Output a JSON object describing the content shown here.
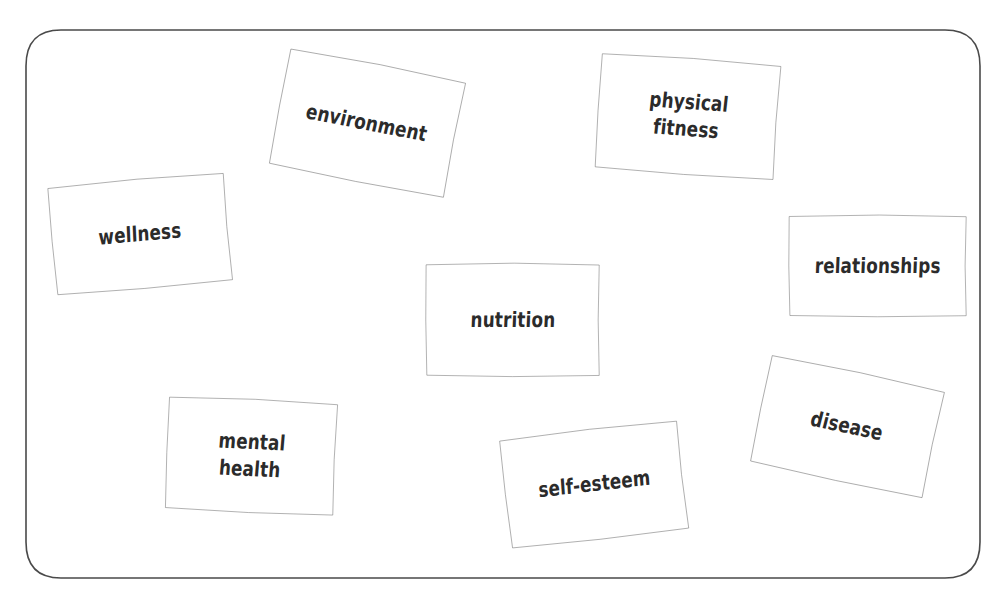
{
  "diagram": {
    "type": "concept-map",
    "title": "",
    "frame": {
      "shape": "rounded-rectangle",
      "stroke_color": "#4a4a4a",
      "fill_color": "#ffffff",
      "corner_radius_px": 36
    },
    "style": {
      "node_shape": "rectangle",
      "node_stroke_color": "#555555",
      "node_fill_color": "#ffffff",
      "label_color": "#2b2b2b",
      "handwritten": true
    },
    "nodes": [
      {
        "id": "environment",
        "label": "environment",
        "x": 276,
        "y": 62,
        "width": 182,
        "height": 122,
        "rotation_deg": 11
      },
      {
        "id": "physical-fitness",
        "label": "physical\nfitness",
        "x": 596,
        "y": 57,
        "width": 183,
        "height": 119,
        "rotation_deg": 4
      },
      {
        "id": "wellness",
        "label": "wellness",
        "x": 50,
        "y": 178,
        "width": 180,
        "height": 112,
        "rotation_deg": -5
      },
      {
        "id": "relationships",
        "label": "relationships",
        "x": 787,
        "y": 214,
        "width": 181,
        "height": 104,
        "rotation_deg": 0
      },
      {
        "id": "nutrition",
        "label": "nutrition",
        "x": 424,
        "y": 262,
        "width": 177,
        "height": 116,
        "rotation_deg": 0
      },
      {
        "id": "disease",
        "label": "disease",
        "x": 757,
        "y": 370,
        "width": 180,
        "height": 113,
        "rotation_deg": 12
      },
      {
        "id": "mental-health",
        "label": "mental\nhealth",
        "x": 165,
        "y": 398,
        "width": 172,
        "height": 116,
        "rotation_deg": 2.5
      },
      {
        "id": "self-esteem",
        "label": "self-esteem",
        "x": 503,
        "y": 428,
        "width": 182,
        "height": 113,
        "rotation_deg": -6.5
      }
    ]
  }
}
